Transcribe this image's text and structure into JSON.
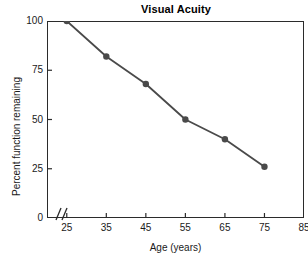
{
  "chart_data": {
    "type": "line",
    "title": "Visual Acuity",
    "xlabel": "Age (years)",
    "ylabel": "Percent function remaining",
    "x": [
      25,
      35,
      45,
      55,
      65,
      75
    ],
    "values": [
      100,
      82,
      68,
      50,
      40,
      26
    ],
    "series": [
      {
        "name": "Percent function remaining",
        "values": [
          100,
          82,
          68,
          50,
          40,
          26
        ],
        "color": "#4a4a4a",
        "marker": "circle"
      }
    ],
    "xlim": [
      20,
      85
    ],
    "ylim": [
      0,
      100
    ],
    "xticks": [
      25,
      35,
      45,
      55,
      65,
      75,
      85
    ],
    "xtick_labels": [
      "25",
      "35",
      "45",
      "55",
      "65",
      "75",
      "85"
    ],
    "yticks": [
      0,
      25,
      50,
      75,
      100
    ],
    "ytick_labels": [
      "0",
      "25",
      "50",
      "75",
      "100"
    ],
    "grid": false,
    "legend": null,
    "axis_break": "//",
    "axis_break_axis": "x",
    "frame": true,
    "line_color": "#4a4a4a",
    "marker_color": "#4a4a4a",
    "background_color": "#ffffff",
    "axis_color": "#2b2b2b"
  }
}
